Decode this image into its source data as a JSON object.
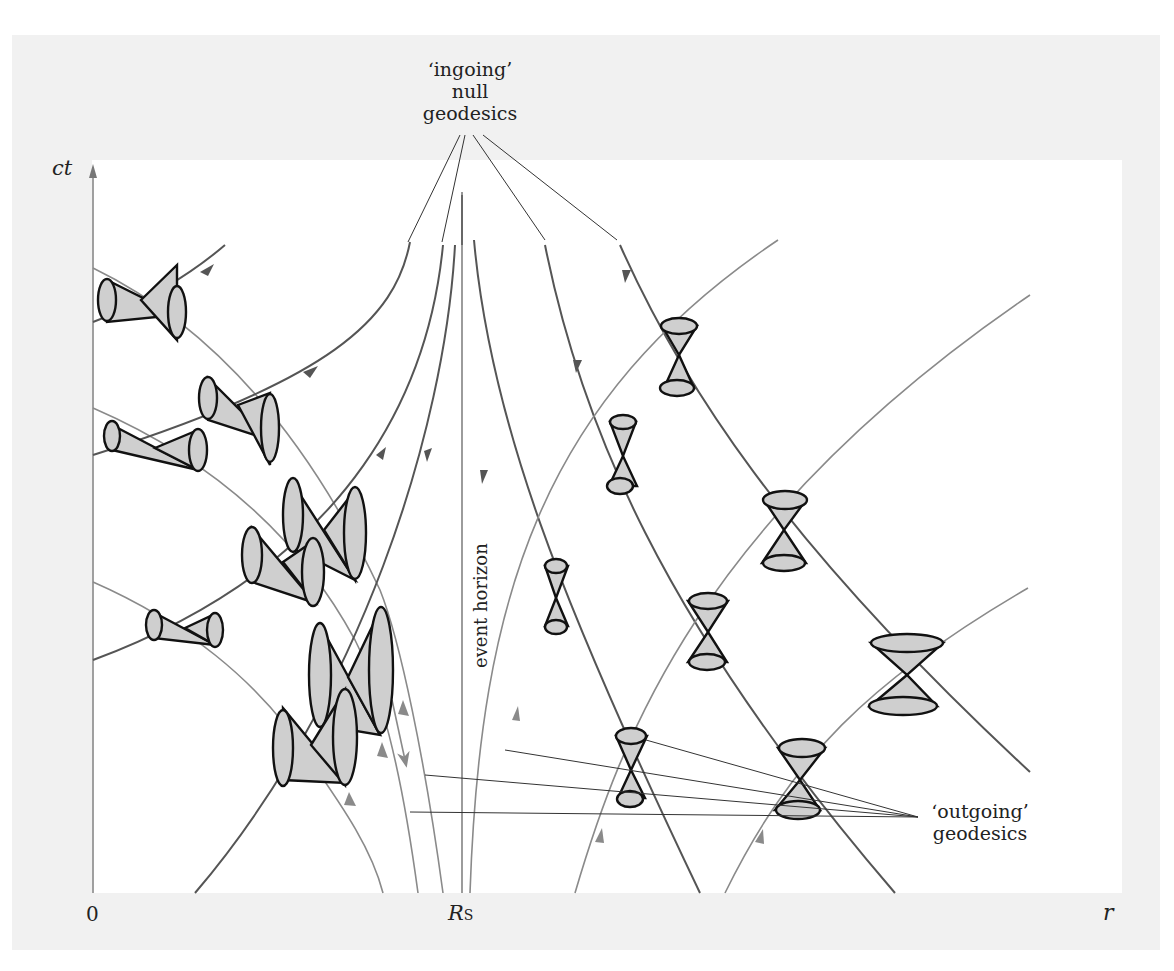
{
  "figure": {
    "axes": {
      "y_label": "ct",
      "x_label": "r",
      "origin_label": "0",
      "schwarzschild_radius_label": "R",
      "schwarzschild_radius_subscript": "S"
    },
    "annotations": {
      "ingoing_line1": "‘ingoing’",
      "ingoing_line2": "null",
      "ingoing_line3": "geodesics",
      "outgoing_line1": "‘outgoing’",
      "outgoing_line2": "geodesics",
      "event_horizon": "event horizon"
    },
    "colors": {
      "frame_background": "#f1f1f1",
      "plot_background": "#ffffff",
      "ingoing_geodesic": "#555555",
      "outgoing_geodesic": "#8a8a8a",
      "cone_fill": "#cfcfcf",
      "cone_outline": "#111111"
    },
    "elements": {
      "ingoing_geodesics_inside_count": 4,
      "ingoing_geodesics_outside_count": 4,
      "outgoing_geodesics_inside_count": 5,
      "outgoing_geodesics_outside_count": 4,
      "light_cones_inside_horizon": 7,
      "light_cones_outside_horizon": 8
    }
  }
}
